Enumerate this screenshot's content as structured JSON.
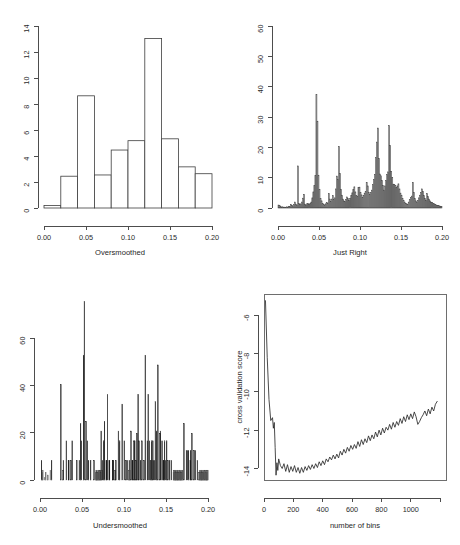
{
  "figure": {
    "background_color": "#ffffff",
    "panel_count": 4
  },
  "panels": [
    {
      "key": "oversmoothed",
      "position": "top-left",
      "xlabel": "Oversmoothed",
      "ylabel": "",
      "xticks": [
        "0.00",
        "0.05",
        "0.10",
        "0.15",
        "0.20"
      ],
      "yticks": [
        "0",
        "2",
        "4",
        "6",
        "8",
        "10",
        "12",
        "14"
      ]
    },
    {
      "key": "justright",
      "position": "top-right",
      "xlabel": "Just Right",
      "ylabel": "",
      "xticks": [
        "0.00",
        "0.05",
        "0.10",
        "0.15",
        "0.20"
      ],
      "yticks": [
        "0",
        "10",
        "20",
        "30",
        "40",
        "50",
        "60"
      ]
    },
    {
      "key": "undersmoothed",
      "position": "bottom-left",
      "xlabel": "Undersmoothed",
      "ylabel": "",
      "xticks": [
        "0.00",
        "0.05",
        "0.10",
        "0.15",
        "0.20"
      ],
      "yticks": [
        "0",
        "20",
        "40",
        "60"
      ]
    },
    {
      "key": "cvscore",
      "position": "bottom-right",
      "xlabel": "number of bins",
      "ylabel": "cross validation score",
      "xticks": [
        "0",
        "200",
        "400",
        "600",
        "800",
        "1000"
      ],
      "yticks": [
        "-6",
        "-8",
        "-10",
        "-12",
        "-14"
      ]
    }
  ],
  "chart_data": [
    {
      "type": "bar",
      "key": "oversmoothed",
      "title": "",
      "xlabel": "Oversmoothed",
      "ylabel": "",
      "xlim": [
        0.0,
        0.2
      ],
      "ylim": [
        0,
        14.6
      ],
      "grid": false,
      "legend": "none",
      "bin_width": 0.02,
      "bin_edges": [
        0.0,
        0.02,
        0.04,
        0.06,
        0.08,
        0.1,
        0.12,
        0.14,
        0.16,
        0.18,
        0.2
      ],
      "values": [
        0.2,
        2.55,
        9.0,
        2.65,
        4.65,
        5.4,
        13.6,
        5.55,
        3.3,
        2.75
      ]
    },
    {
      "type": "bar",
      "key": "justright",
      "title": "",
      "xlabel": "Just Right",
      "ylabel": "",
      "xlim": [
        0.0,
        0.2
      ],
      "ylim": [
        0,
        61
      ],
      "grid": false,
      "legend": "none",
      "bin_width": 0.00125,
      "n_bins": 160,
      "values": [
        1.0,
        0.8,
        0.6,
        0.3,
        0.4,
        0.2,
        0.3,
        0.2,
        0.4,
        0.3,
        0.6,
        0.5,
        1.2,
        0.9,
        0.7,
        1.1,
        2.0,
        1.3,
        1.0,
        14.1,
        1.6,
        1.1,
        1.4,
        2.0,
        3.3,
        4.6,
        1.3,
        1.0,
        1.4,
        1.6,
        1.2,
        1.5,
        2.0,
        3.4,
        5.4,
        7.5,
        10.9,
        38.0,
        29.1,
        11.0,
        6.2,
        3.1,
        2.4,
        1.6,
        1.2,
        1.0,
        1.4,
        1.9,
        1.6,
        4.8,
        3.0,
        2.1,
        3.0,
        4.1,
        2.8,
        3.4,
        6.4,
        10.7,
        9.6,
        20.6,
        11.6,
        6.3,
        4.3,
        3.0,
        2.4,
        2.1,
        2.9,
        3.7,
        3.2,
        2.6,
        3.1,
        4.2,
        5.1,
        6.2,
        7.1,
        5.4,
        4.1,
        3.8,
        6.8,
        7.0,
        5.2,
        4.4,
        3.5,
        4.2,
        5.0,
        5.6,
        8.6,
        7.4,
        5.3,
        4.6,
        5.2,
        6.0,
        7.8,
        9.5,
        11.3,
        16.9,
        22.1,
        26.8,
        16.6,
        11.4,
        10.8,
        9.2,
        7.6,
        6.0,
        7.4,
        9.2,
        11.2,
        12.1,
        27.6,
        21.0,
        12.3,
        10.3,
        8.0,
        7.8,
        7.6,
        6.9,
        7.4,
        8.1,
        6.4,
        5.0,
        4.3,
        3.2,
        2.6,
        2.0,
        1.6,
        1.4,
        1.2,
        2.0,
        2.8,
        3.5,
        4.0,
        8.6,
        5.2,
        3.1,
        2.4,
        2.0,
        2.6,
        3.4,
        4.3,
        5.2,
        6.4,
        5.6,
        4.1,
        3.2,
        2.6,
        4.8,
        3.8,
        3.0,
        2.4,
        2.0,
        1.8,
        1.6,
        1.4,
        1.2,
        1.0,
        0.9,
        0.8,
        0.7,
        0.6,
        0.5
      ]
    },
    {
      "type": "bar",
      "key": "undersmoothed",
      "title": "",
      "xlabel": "Undersmoothed",
      "ylabel": "",
      "xlim": [
        0.0,
        0.2
      ],
      "ylim": [
        0,
        76
      ],
      "grid": false,
      "legend": "none",
      "bin_width": 0.0005,
      "n_bins": 400,
      "peak_value": 73,
      "values": [
        0,
        0,
        0,
        8,
        0,
        3,
        4,
        0,
        0,
        0,
        1,
        0,
        0,
        3,
        0,
        0,
        0,
        0,
        2,
        0,
        0,
        0,
        0,
        0,
        4,
        0,
        0,
        8,
        0,
        0,
        0,
        0,
        0,
        0,
        0,
        0,
        0,
        0,
        0,
        0,
        0,
        0,
        0,
        0,
        0,
        0,
        0,
        0,
        0,
        39,
        0,
        0,
        0,
        0,
        4,
        8,
        0,
        0,
        0,
        0,
        0,
        0,
        16,
        0,
        0,
        0,
        0,
        8,
        8,
        0,
        0,
        0,
        0,
        8,
        0,
        0,
        16,
        0,
        0,
        0,
        0,
        0,
        0,
        0,
        0,
        0,
        0,
        8,
        0,
        0,
        0,
        0,
        0,
        8,
        0,
        0,
        23,
        0,
        16,
        0,
        0,
        0,
        0,
        51,
        0,
        73,
        0,
        0,
        0,
        24,
        0,
        0,
        16,
        0,
        0,
        8,
        0,
        0,
        0,
        0,
        8,
        0,
        0,
        0,
        0,
        0,
        0,
        0,
        8,
        0,
        0,
        0,
        3,
        4,
        4,
        3,
        4,
        3,
        3,
        4,
        4,
        3,
        4,
        4,
        3,
        20,
        0,
        4,
        8,
        0,
        0,
        16,
        0,
        24,
        0,
        0,
        0,
        8,
        8,
        0,
        35,
        0,
        0,
        0,
        8,
        8,
        0,
        0,
        0,
        0,
        0,
        0,
        8,
        8,
        8,
        0,
        0,
        0,
        4,
        4,
        8,
        0,
        0,
        0,
        0,
        0,
        20,
        0,
        0,
        16,
        0,
        0,
        0,
        0,
        0,
        31,
        0,
        0,
        0,
        0,
        16,
        0,
        0,
        0,
        8,
        0,
        0,
        8,
        0,
        0,
        0,
        4,
        8,
        4,
        0,
        0,
        20,
        0,
        0,
        8,
        8,
        0,
        0,
        16,
        0,
        16,
        0,
        0,
        8,
        0,
        19,
        0,
        0,
        35,
        0,
        16,
        0,
        0,
        0,
        8,
        0,
        0,
        16,
        0,
        0,
        0,
        0,
        8,
        0,
        0,
        51,
        0,
        0,
        0,
        0,
        16,
        0,
        35,
        0,
        0,
        16,
        0,
        0,
        8,
        0,
        16,
        0,
        0,
        16,
        8,
        0,
        0,
        8,
        0,
        32,
        0,
        0,
        20,
        0,
        0,
        47,
        0,
        0,
        0,
        0,
        19,
        20,
        0,
        0,
        0,
        16,
        0,
        0,
        8,
        8,
        0,
        16,
        0,
        8,
        0,
        0,
        16,
        0,
        0,
        8,
        0,
        0,
        0,
        8,
        0,
        0,
        0,
        8,
        0,
        0,
        0,
        0,
        3,
        4,
        4,
        3,
        4,
        4,
        3,
        4,
        3,
        4,
        4,
        3,
        4,
        3,
        4,
        4,
        3,
        4,
        3,
        4,
        3,
        4,
        4,
        0,
        0,
        23,
        0,
        0,
        0,
        0,
        0,
        12,
        0,
        12,
        0,
        0,
        12,
        0,
        0,
        0,
        8,
        12,
        0,
        0,
        19,
        0,
        0,
        0,
        0,
        12,
        0,
        0,
        12,
        0,
        0,
        0,
        0,
        8,
        0,
        0,
        0,
        3,
        4,
        3,
        4,
        3,
        4,
        4,
        3,
        4,
        3,
        4,
        3,
        4,
        3,
        4,
        4,
        3,
        4,
        3,
        4,
        3,
        4
      ]
    },
    {
      "type": "line",
      "key": "cvscore",
      "title": "",
      "xlabel": "number of bins",
      "ylabel": "cross validation score",
      "xlim": [
        0,
        1240
      ],
      "ylim": [
        -14.6,
        -4.9
      ],
      "grid": false,
      "legend": "none",
      "x": [
        10,
        22,
        34,
        46,
        58,
        64,
        70,
        76,
        82,
        88,
        94,
        100,
        112,
        124,
        136,
        148,
        160,
        172,
        184,
        196,
        208,
        220,
        232,
        244,
        256,
        268,
        280,
        292,
        304,
        316,
        328,
        340,
        352,
        364,
        376,
        388,
        400,
        412,
        424,
        436,
        448,
        460,
        472,
        484,
        496,
        508,
        520,
        532,
        544,
        556,
        568,
        580,
        592,
        604,
        616,
        628,
        640,
        652,
        664,
        676,
        688,
        700,
        712,
        724,
        736,
        748,
        760,
        772,
        784,
        796,
        808,
        820,
        832,
        844,
        856,
        868,
        880,
        892,
        904,
        916,
        928,
        940,
        952,
        964,
        976,
        988,
        1000,
        1012,
        1024,
        1036,
        1048,
        1060,
        1072,
        1084,
        1096,
        1108,
        1120,
        1132,
        1144,
        1156,
        1168,
        1180
      ],
      "y": [
        -5.25,
        -8.2,
        -10.4,
        -11.5,
        -11.35,
        -11.9,
        -11.6,
        -12.9,
        -14.35,
        -13.7,
        -14.1,
        -13.5,
        -13.85,
        -14.0,
        -13.75,
        -14.15,
        -13.8,
        -14.2,
        -13.9,
        -14.15,
        -13.85,
        -14.2,
        -13.95,
        -14.25,
        -13.95,
        -14.2,
        -13.9,
        -14.1,
        -13.85,
        -14.05,
        -13.8,
        -14.0,
        -13.75,
        -13.95,
        -13.65,
        -13.85,
        -13.6,
        -13.8,
        -13.5,
        -13.65,
        -13.4,
        -13.55,
        -13.3,
        -13.5,
        -13.25,
        -13.45,
        -13.1,
        -13.3,
        -13.0,
        -13.2,
        -12.9,
        -13.1,
        -12.8,
        -13.0,
        -12.75,
        -12.95,
        -12.6,
        -12.85,
        -12.5,
        -12.75,
        -12.45,
        -12.65,
        -12.3,
        -12.55,
        -12.25,
        -12.45,
        -12.1,
        -12.35,
        -12.0,
        -12.25,
        -11.9,
        -12.15,
        -11.85,
        -12.0,
        -11.7,
        -11.95,
        -11.6,
        -11.85,
        -11.55,
        -11.75,
        -11.4,
        -11.65,
        -11.3,
        -11.55,
        -11.2,
        -11.45,
        -11.15,
        -11.4,
        -11.05,
        -11.3,
        -11.7,
        -11.55,
        -11.35,
        -11.2,
        -11.0,
        -11.25,
        -10.9,
        -11.15,
        -10.8,
        -11.0,
        -10.65,
        -10.5
      ]
    }
  ]
}
